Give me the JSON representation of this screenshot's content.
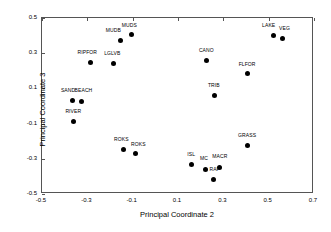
{
  "chart_data": {
    "type": "scatter",
    "title": "",
    "xlabel": "Principal Coordinate 2",
    "ylabel": "Principal Coordinate 3",
    "xlim": [
      -0.5,
      0.7
    ],
    "ylim": [
      -0.5,
      0.5
    ],
    "xticks": [
      -0.5,
      -0.3,
      -0.1,
      0.1,
      0.3,
      0.5,
      0.7
    ],
    "xticklabels": [
      "-0.5",
      "-0.3",
      "-0.1",
      "0.1",
      "0.3",
      "0.5",
      "0.7"
    ],
    "yticks": [
      0.5,
      0.3,
      0.1,
      -0.1,
      -0.3,
      -0.5
    ],
    "yticklabels": [
      "0.5",
      "0.3",
      "0.1",
      "-0.1",
      "-0.3",
      "-0.5"
    ],
    "grid": false,
    "legend": null,
    "marker": "filled-circle",
    "marker_color": "#000000",
    "points": [
      {
        "label": "MUDB",
        "x": -0.155,
        "y": 0.372,
        "lx": -0.185,
        "ly": 0.412
      },
      {
        "label": "MUDS",
        "x": -0.105,
        "y": 0.406,
        "lx": -0.115,
        "ly": 0.446
      },
      {
        "label": "LAKE",
        "x": 0.52,
        "y": 0.4,
        "lx": 0.5,
        "ly": 0.445
      },
      {
        "label": "VEG",
        "x": 0.56,
        "y": 0.383,
        "lx": 0.57,
        "ly": 0.428
      },
      {
        "label": "CANO",
        "x": 0.225,
        "y": 0.258,
        "lx": 0.225,
        "ly": 0.3
      },
      {
        "label": "RIPFOR",
        "x": -0.287,
        "y": 0.245,
        "lx": -0.3,
        "ly": 0.287
      },
      {
        "label": "LGLVB",
        "x": -0.185,
        "y": 0.24,
        "lx": -0.19,
        "ly": 0.284
      },
      {
        "label": "FLFOR",
        "x": 0.405,
        "y": 0.182,
        "lx": 0.405,
        "ly": 0.224
      },
      {
        "label": "TRIB",
        "x": 0.26,
        "y": 0.058,
        "lx": 0.258,
        "ly": 0.1
      },
      {
        "label": "SAND",
        "x": -0.365,
        "y": 0.033,
        "lx": -0.385,
        "ly": 0.075
      },
      {
        "label": "BEACH",
        "x": -0.325,
        "y": 0.027,
        "lx": -0.317,
        "ly": 0.074
      },
      {
        "label": "RIVER",
        "x": -0.36,
        "y": -0.09,
        "lx": -0.362,
        "ly": -0.046
      },
      {
        "label": "GRASS",
        "x": 0.405,
        "y": -0.222,
        "lx": 0.405,
        "ly": -0.18
      },
      {
        "label": "ROKS",
        "x": -0.14,
        "y": -0.245,
        "lx": -0.15,
        "ly": -0.203
      },
      {
        "label": "ROKS",
        "x": -0.087,
        "y": -0.268,
        "lx": -0.075,
        "ly": -0.232
      },
      {
        "label": "ISL",
        "x": 0.16,
        "y": -0.333,
        "lx": 0.158,
        "ly": -0.292
      },
      {
        "label": "MC",
        "x": 0.222,
        "y": -0.358,
        "lx": 0.215,
        "ly": -0.315
      },
      {
        "label": "MACR",
        "x": 0.283,
        "y": -0.347,
        "lx": 0.285,
        "ly": -0.303
      },
      {
        "label": "RAP",
        "x": 0.258,
        "y": -0.418,
        "lx": 0.262,
        "ly": -0.375
      }
    ]
  }
}
